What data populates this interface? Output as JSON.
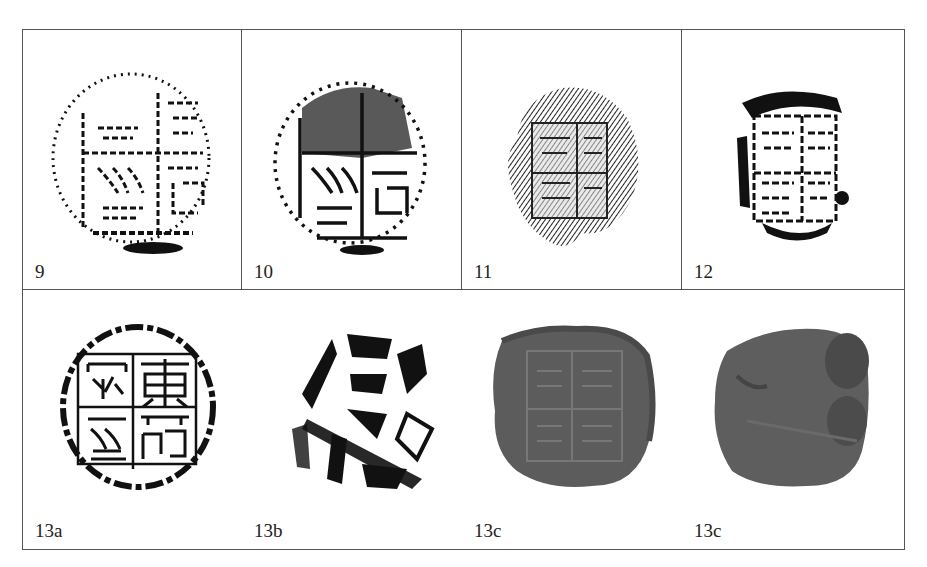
{
  "figure": {
    "top_row": [
      {
        "label": "9",
        "type": "rubbing",
        "description": "seal rubbing, four-character inscription in quadrants, light print"
      },
      {
        "label": "10",
        "type": "rubbing",
        "description": "seal rubbing, four-character inscription, heavy ink upper-left"
      },
      {
        "label": "11",
        "type": "rubbing",
        "description": "seal rubbing, textured ink, square frame with four characters"
      },
      {
        "label": "12",
        "type": "rubbing",
        "description": "seal rubbing, square frame, four characters"
      }
    ],
    "bottom_row": [
      {
        "label": "13a",
        "type": "rubbing",
        "description": "round seal rubbing with four characters in quadrants (東 ... )"
      },
      {
        "label": "13b",
        "type": "rubbing",
        "description": "rubbing of seal reverse, irregular marks"
      },
      {
        "label": "13c",
        "type": "photo",
        "description": "photograph of clay sealing, obverse"
      },
      {
        "label": "13c",
        "type": "photo",
        "description": "photograph of clay sealing, reverse"
      }
    ]
  },
  "colors": {
    "ink": "#111111",
    "border": "#555555",
    "clay": "#5a5a5a"
  }
}
